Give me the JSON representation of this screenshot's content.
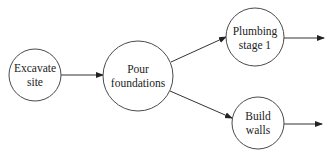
{
  "diagram": {
    "type": "activity-on-node network",
    "nodes": [
      {
        "id": "excavate",
        "lines": [
          "Excavate",
          "site"
        ],
        "cx": 35,
        "cy": 75,
        "r": 26
      },
      {
        "id": "foundations",
        "lines": [
          "Pour",
          "foundations"
        ],
        "cx": 138,
        "cy": 76,
        "r": 35
      },
      {
        "id": "plumbing",
        "lines": [
          "Plumbing",
          "stage 1"
        ],
        "cx": 255,
        "cy": 37,
        "r": 29
      },
      {
        "id": "walls",
        "lines": [
          "Build",
          "walls"
        ],
        "cx": 258,
        "cy": 123,
        "r": 26
      }
    ],
    "edges": [
      {
        "from": "excavate",
        "to": "foundations"
      },
      {
        "from": "foundations",
        "to": "plumbing"
      },
      {
        "from": "foundations",
        "to": "walls"
      },
      {
        "from": "plumbing",
        "to": "(continues)"
      },
      {
        "from": "walls",
        "to": "(continues)"
      }
    ]
  },
  "labels": {
    "excavate_l1": "Excavate",
    "excavate_l2": "site",
    "foundations_l1": "Pour",
    "foundations_l2": "foundations",
    "plumbing_l1": "Plumbing",
    "plumbing_l2": "stage 1",
    "walls_l1": "Build",
    "walls_l2": "walls"
  },
  "colors": {
    "stroke": "#4a4a4a",
    "text": "#222222",
    "background": "#ffffff"
  }
}
